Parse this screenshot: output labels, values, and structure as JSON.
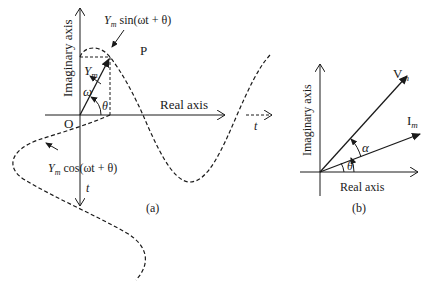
{
  "figure": {
    "panel_a": {
      "caption": "(a)",
      "vertical_axis_label": "Imaginary axis",
      "horizontal_axis_label": "Real axis",
      "origin_label": "O",
      "point_label": "P",
      "phasor_label": "Y",
      "phasor_sub": "m",
      "omega_label": "ω",
      "theta_label": "θ",
      "sin_label": {
        "amp": "Y",
        "sub": "m",
        "expr": " sin(ωt + θ)"
      },
      "cos_label": {
        "amp": "Y",
        "sub": "m",
        "expr": " cos(ωt + θ)"
      },
      "time_label_down": "t",
      "time_label_right": "t"
    },
    "panel_b": {
      "caption": "(b)",
      "vertical_axis_label": "Imaginary axis",
      "horizontal_axis_label": "Real axis",
      "voltage_phasor": {
        "base": "V",
        "sub": "m"
      },
      "current_phasor": {
        "base": "I",
        "sub": "m"
      },
      "alpha_label": "α",
      "theta_label": "θ"
    },
    "colors": {
      "ink": "#1a1a1a",
      "background": "#ffffff"
    }
  }
}
